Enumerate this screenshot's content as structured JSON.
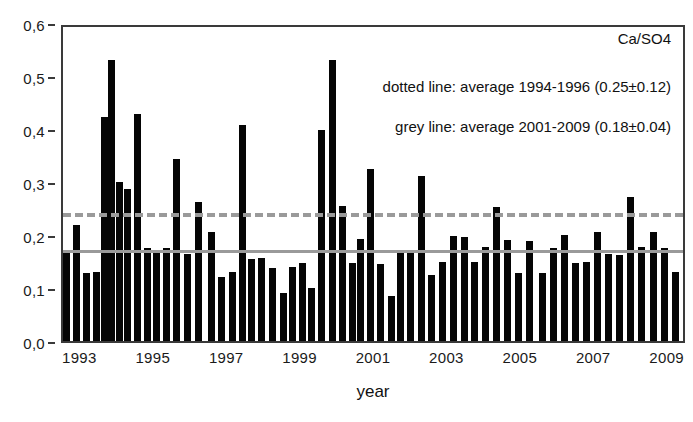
{
  "chart_data": {
    "type": "bar",
    "title": "",
    "series_label": "Ca/SO4",
    "xlabel": "year",
    "ylabel": "",
    "ylim": [
      0.0,
      0.6
    ],
    "xlim": [
      1993.0,
      2010.0
    ],
    "grid": false,
    "legend_position": "top-right (text annotations)",
    "y_ticks": [
      0.0,
      0.1,
      0.2,
      0.3,
      0.4,
      0.5,
      0.6
    ],
    "y_ticklabels": [
      "0,0",
      "0,1",
      "0,2",
      "0,3",
      "0,4",
      "0,5",
      "0,6"
    ],
    "x_ticks": [
      1993,
      1995,
      1997,
      1999,
      2001,
      2003,
      2005,
      2007,
      2009
    ],
    "x_ticklabels": [
      "1993",
      "1995",
      "1997",
      "1999",
      "2001",
      "2003",
      "2005",
      "2007",
      "2009"
    ],
    "annotations": [
      "dotted line: average 1994-1996 (0.25±0.12)",
      "grey line: average 2001-2009 (0.18±0.04)"
    ],
    "reference_lines": [
      {
        "name": "average-1994-1996",
        "style": "dashed",
        "color": "#9a9a9a",
        "value": 0.25,
        "label": "dotted line: average 1994-1996 (0.25±0.12)"
      },
      {
        "name": "average-2001-2009",
        "style": "solid",
        "color": "#9a9a9a",
        "value": 0.18,
        "label": "grey line: average 2001-2009 (0.18±0.04)"
      }
    ],
    "bar_color": "#050505",
    "x": [
      1993.1,
      1993.37,
      1993.64,
      1993.91,
      1994.12,
      1994.33,
      1994.55,
      1994.76,
      1995.04,
      1995.3,
      1995.56,
      1995.82,
      1996.1,
      1996.4,
      1996.7,
      1997.05,
      1997.33,
      1997.61,
      1997.89,
      1998.14,
      1998.42,
      1998.7,
      1999.0,
      1999.26,
      1999.52,
      1999.78,
      2000.05,
      2000.33,
      2000.61,
      2000.89,
      2001.1,
      2001.38,
      2001.66,
      2001.94,
      2002.2,
      2002.48,
      2002.76,
      2003.05,
      2003.35,
      2003.65,
      2003.95,
      2004.22,
      2004.52,
      2004.82,
      2005.1,
      2005.4,
      2005.7,
      2006.05,
      2006.35,
      2006.65,
      2006.95,
      2007.25,
      2007.55,
      2007.85,
      2008.15,
      2008.45,
      2008.75,
      2009.1,
      2009.4,
      2009.7
    ],
    "values": [
      0.168,
      0.218,
      0.128,
      0.13,
      0.422,
      0.53,
      0.3,
      0.286,
      0.428,
      0.175,
      0.172,
      0.175,
      0.343,
      0.165,
      0.263,
      0.205,
      0.12,
      0.13,
      0.408,
      0.155,
      0.157,
      0.137,
      0.09,
      0.14,
      0.148,
      0.1,
      0.398,
      0.53,
      0.255,
      0.148,
      0.193,
      0.325,
      0.145,
      0.085,
      0.168,
      0.17,
      0.311,
      0.125,
      0.15,
      0.198,
      0.196,
      0.15,
      0.178,
      0.253,
      0.19,
      0.128,
      0.188,
      0.128,
      0.175,
      0.2,
      0.148,
      0.15,
      0.205,
      0.165,
      0.163,
      0.272,
      0.178,
      0.205,
      0.175,
      0.13
    ]
  }
}
